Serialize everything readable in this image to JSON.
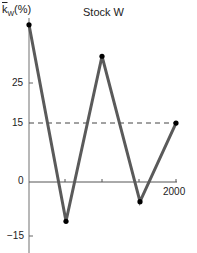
{
  "chart_data": {
    "type": "line",
    "title": "Stock W",
    "xlabel": "",
    "ylabel": "k̄w(%)",
    "x": [
      1996,
      1997,
      1998,
      1999,
      2000
    ],
    "series": [
      {
        "name": "Stock W return",
        "values": [
          40,
          -10,
          32,
          -5,
          15
        ]
      }
    ],
    "reference_lines": [
      {
        "y": 15,
        "style": "dashed",
        "label": "average return"
      }
    ],
    "yticks": [
      -15,
      0,
      15,
      25
    ],
    "xticks_labeled": [
      "2000"
    ],
    "ylim": [
      -18,
      42
    ],
    "grid": false,
    "colors": {
      "line": "#5a5a5a",
      "marker": "#000000",
      "axis": "#999999",
      "dashed": "#444444"
    }
  },
  "labels": {
    "title": "Stock W",
    "y_axis_k": "k",
    "y_axis_sub": "W",
    "y_axis_pct": "(%)",
    "tick_25": "25",
    "tick_15": "15",
    "tick_0": "0",
    "tick_m15": "−15",
    "x_2000": "2000"
  }
}
